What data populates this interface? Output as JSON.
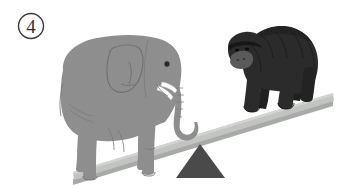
{
  "figure": {
    "panel_label": "4",
    "panel_label_style": "circled-number",
    "background_color": "#ffffff",
    "caption": ""
  },
  "diagram": {
    "type": "balance-scale-comparison",
    "tilt": "left-side-down",
    "heavier_side": "left"
  },
  "elements": {
    "elephant": {
      "name": "elephant",
      "side": "left",
      "color": "#8e8e8e",
      "outline_color": "#6f6f6f",
      "tusk_color": "#ffffff",
      "eye_color": "#2a2a2a",
      "facing": "right"
    },
    "gorilla": {
      "name": "gorilla",
      "side": "right",
      "color": "#2b2b2b",
      "muzzle_color": "#5a5a5a",
      "facing": "left"
    },
    "plank": {
      "name": "balance-plank",
      "color": "#c2c4c2",
      "shadow_color": "#a8aaa8",
      "left_end": "73,176",
      "right_end": "333,97"
    },
    "fulcrum": {
      "name": "fulcrum-triangle",
      "color": "#4a4a4a",
      "shape": "triangle",
      "apex": "200,144",
      "base_left": "176,178",
      "base_right": "225,178"
    }
  }
}
